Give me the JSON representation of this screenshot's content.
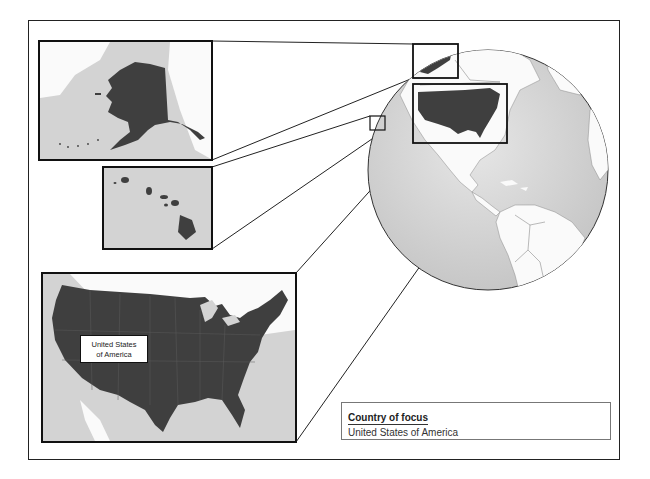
{
  "map": {
    "type": "locator-map",
    "focus_country": "United States of America",
    "insets": [
      {
        "name": "Alaska",
        "region": "alaska"
      },
      {
        "name": "Hawaii",
        "region": "hawaii"
      },
      {
        "name": "Contiguous United States",
        "region": "contiguous-us",
        "label": "United States of America"
      }
    ],
    "globe_view": "Western Hemisphere (North & South America)"
  },
  "label": {
    "line1": "United States",
    "line2": "of America"
  },
  "legend": {
    "title": "Country of focus",
    "value": "United States of America"
  },
  "colors": {
    "focus_land": "#3f3f3f",
    "other_land": "#ffffff",
    "ocean": "#d4d4d4",
    "border": "#222222"
  }
}
